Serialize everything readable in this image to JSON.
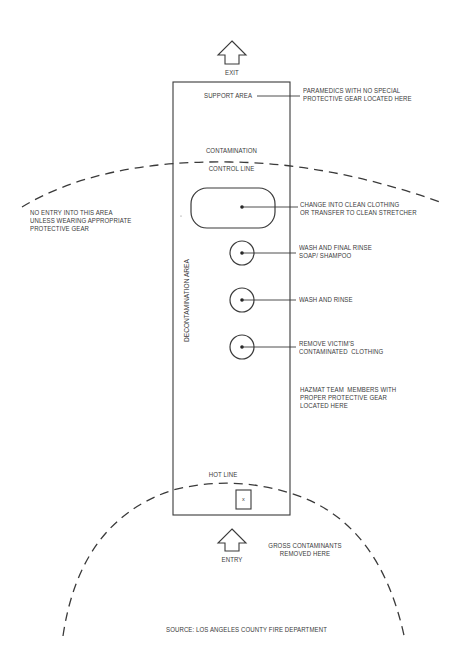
{
  "diagram": {
    "type": "decontamination-zone-layout",
    "colors": {
      "line": "#3a3a3a",
      "background": "#ffffff"
    },
    "arrows": {
      "exit": {
        "label": "EXIT",
        "direction": "up"
      },
      "entry": {
        "label": "ENTRY",
        "direction": "up"
      }
    },
    "corridor": {
      "top_label": "SUPPORT AREA",
      "side_label": "DECONTAMINATION AREA",
      "contamination_line": {
        "line1": "CONTAMINATION",
        "line2": "CONTROL LINE"
      },
      "hot_line": "HOT LINE",
      "box_marker": "x"
    },
    "stations": [
      {
        "shape": "rounded-rect",
        "label_line1": "CHANGE INTO CLEAN CLOTHING",
        "label_line2": "OR TRANSFER TO CLEAN STRETCHER"
      },
      {
        "shape": "circle",
        "label_line1": "WASH AND FINAL RINSE",
        "label_line2": "SOAP/ SHAMPOO"
      },
      {
        "shape": "circle",
        "label_line1": "WASH AND RINSE",
        "label_line2": ""
      },
      {
        "shape": "circle",
        "label_line1": "REMOVE VICTIM'S",
        "label_line2": "CONTAMINATED  CLOTHING"
      }
    ],
    "annotations": {
      "paramedics": {
        "line1": "PARAMEDICS WITH NO SPECIAL",
        "line2": "PROTECTIVE GEAR LOCATED HERE"
      },
      "no_entry": {
        "line1": "NO ENTRY INTO THIS AREA",
        "line2": "UNLESS WEARING APPROPRIATE",
        "line3": "PROTECTIVE GEAR"
      },
      "hazmat": {
        "line1": "HAZMAT TEAM  MEMBERS WITH",
        "line2": "PROPER PROTECTIVE GEAR",
        "line3": "LOCATED HERE"
      },
      "gross": {
        "line1": "GROSS CONTAMINANTS",
        "line2": "REMOVED HERE"
      }
    },
    "source": "SOURCE: LOS ANGELES COUNTY FIRE DEPARTMENT"
  }
}
